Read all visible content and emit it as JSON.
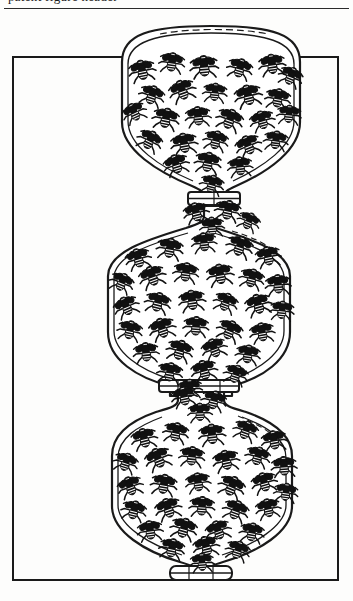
{
  "page": {
    "width": 353,
    "height": 601,
    "background_color": "#fdfdfc",
    "ink_color": "#1a1a1a",
    "type": "scanned-line-art-illustration"
  },
  "header": {
    "clipped_text": "patent figure header",
    "rule_color": "#2a2a2a"
  },
  "frame": {
    "label": "figure-border",
    "left": 13,
    "top": 57,
    "right": 338,
    "bottom": 580,
    "stroke_color": "#1a1a1a",
    "stroke_width": 2
  },
  "figure": {
    "vessel_count": 3,
    "neck_count": 3,
    "stroke_color": "#1a1a1a",
    "fill_color": "#ffffff",
    "vessels": [
      {
        "name": "upper-vessel",
        "label": "Upper chamber",
        "center_x": 211,
        "top_y": 28,
        "bottom_y": 190,
        "left_x": 122,
        "right_x": 300,
        "fly_count": 26
      },
      {
        "name": "middle-vessel",
        "label": "Middle chamber",
        "center_x": 199,
        "top_y": 228,
        "bottom_y": 388,
        "left_x": 108,
        "right_x": 290,
        "fly_count": 30
      },
      {
        "name": "lower-vessel",
        "label": "Lower chamber",
        "center_x": 201,
        "top_y": 412,
        "bottom_y": 578,
        "left_x": 112,
        "right_x": 292,
        "fly_count": 30
      }
    ],
    "necks": [
      {
        "name": "upper-neck-collar",
        "center_x": 214,
        "y": 196,
        "width": 52,
        "height": 13
      },
      {
        "name": "middle-neck-collar",
        "center_x": 199,
        "y": 386,
        "width": 80,
        "height": 12
      },
      {
        "name": "base-foot-collar",
        "center_x": 201,
        "y": 570,
        "width": 62,
        "height": 14
      }
    ],
    "contents": {
      "item": "fly",
      "item_plural": "flies",
      "total_count": 86,
      "color": "#111111"
    }
  }
}
